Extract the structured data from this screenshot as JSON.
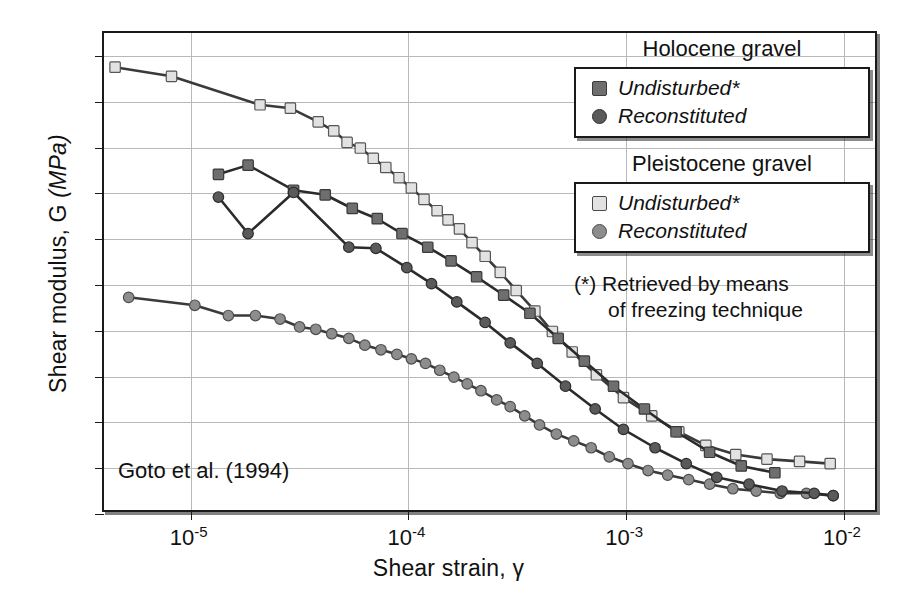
{
  "chart_data": {
    "type": "line",
    "title": "",
    "source_annotation": "Goto et al. (1994)",
    "xlabel": "Shear strain, γ",
    "ylabel": "Shear modulus, G (MPa)",
    "ylabel_plain": "Shear modulus, G ",
    "ylabel_italic": "(MPa)",
    "xscale": "log",
    "xlim": [
      4e-06,
      0.0145
    ],
    "ylim": [
      0,
      210
    ],
    "yticks": [
      0,
      20,
      40,
      60,
      80,
      100,
      120,
      140,
      160,
      180,
      200
    ],
    "ytick_labels": [
      "0",
      "20",
      "40",
      "60",
      "80",
      "100",
      "120",
      "140",
      "160",
      "180",
      "200"
    ],
    "xticks": [
      1e-05,
      0.0001,
      0.001,
      0.01
    ],
    "xtick_labels": [
      "10-5",
      "10-4",
      "10-3",
      "10-2"
    ],
    "xtick_mantissa": [
      "10",
      "10",
      "10",
      "10"
    ],
    "xtick_exponent": [
      "-5",
      "-4",
      "-3",
      "-2"
    ],
    "grid": true,
    "legend_position": "top-right",
    "series": [
      {
        "name": "Pleistocene gravel — Undisturbed*",
        "group": "Pleistocene gravel",
        "condition": "Undisturbed*",
        "marker": "square",
        "color": "#e2e2e2",
        "edge": "#555555",
        "line_color": "#3a3a3a",
        "points": [
          [
            4.5e-06,
            195
          ],
          [
            8.2e-06,
            191
          ],
          [
            2.1e-05,
            178.5
          ],
          [
            2.9e-05,
            177
          ],
          [
            3.9e-05,
            171
          ],
          [
            4.6e-05,
            167
          ],
          [
            5.3e-05,
            162
          ],
          [
            6.1e-05,
            159.5
          ],
          [
            7e-05,
            155
          ],
          [
            8e-05,
            151
          ],
          [
            9.2e-05,
            146.5
          ],
          [
            0.000105,
            142
          ],
          [
            0.00012,
            137
          ],
          [
            0.000138,
            132
          ],
          [
            0.000155,
            128
          ],
          [
            0.000175,
            124
          ],
          [
            0.0002,
            118
          ],
          [
            0.00023,
            112
          ],
          [
            0.00027,
            105
          ],
          [
            0.00032,
            97
          ],
          [
            0.00039,
            88
          ],
          [
            0.00047,
            79
          ],
          [
            0.00058,
            70
          ],
          [
            0.00075,
            60
          ],
          [
            0.001,
            50
          ],
          [
            0.00135,
            42
          ],
          [
            0.0018,
            35
          ],
          [
            0.0024,
            29
          ],
          [
            0.0033,
            25
          ],
          [
            0.0046,
            23
          ],
          [
            0.0065,
            22
          ],
          [
            0.009,
            21
          ]
        ]
      },
      {
        "name": "Holocene gravel — Undisturbed*",
        "group": "Holocene gravel",
        "condition": "Undisturbed*",
        "marker": "square",
        "color": "#6e6e6e",
        "edge": "#3a3a3a",
        "line_color": "#2b2b2b",
        "points": [
          [
            1.35e-05,
            148
          ],
          [
            1.85e-05,
            152
          ],
          [
            3e-05,
            141
          ],
          [
            4.2e-05,
            139
          ],
          [
            5.6e-05,
            133
          ],
          [
            7.3e-05,
            128.5
          ],
          [
            9.5e-05,
            122
          ],
          [
            0.000125,
            116
          ],
          [
            0.00016,
            110
          ],
          [
            0.00021,
            103
          ],
          [
            0.00028,
            95
          ],
          [
            0.00037,
            87
          ],
          [
            0.0005,
            76
          ],
          [
            0.00066,
            66
          ],
          [
            0.0009,
            55
          ],
          [
            0.00125,
            45
          ],
          [
            0.00175,
            35
          ],
          [
            0.0025,
            26
          ],
          [
            0.0035,
            20
          ],
          [
            0.005,
            17
          ]
        ]
      },
      {
        "name": "Holocene gravel — Reconstituted",
        "group": "Holocene gravel",
        "condition": "Reconstituted",
        "marker": "circle",
        "color": "#5a5a5a",
        "edge": "#2e2e2e",
        "line_color": "#2b2b2b",
        "points": [
          [
            1.35e-05,
            138
          ],
          [
            1.85e-05,
            122
          ],
          [
            3e-05,
            140
          ],
          [
            5.4e-05,
            116
          ],
          [
            7.2e-05,
            115.5
          ],
          [
            0.0001,
            107
          ],
          [
            0.00013,
            100
          ],
          [
            0.00017,
            92
          ],
          [
            0.00023,
            83
          ],
          [
            0.0003,
            74
          ],
          [
            0.0004,
            65
          ],
          [
            0.00054,
            55
          ],
          [
            0.00074,
            45
          ],
          [
            0.001,
            36
          ],
          [
            0.0014,
            28
          ],
          [
            0.00195,
            21
          ],
          [
            0.0027,
            15
          ],
          [
            0.0038,
            12
          ],
          [
            0.0054,
            9
          ],
          [
            0.0076,
            8
          ],
          [
            0.0093,
            7
          ]
        ]
      },
      {
        "name": "Pleistocene gravel — Reconstituted",
        "group": "Pleistocene gravel",
        "condition": "Reconstituted",
        "marker": "circle",
        "color": "#8d8d8d",
        "edge": "#4e4e4e",
        "line_color": "#3a3a3a",
        "points": [
          [
            5.2e-06,
            94
          ],
          [
            1.05e-05,
            90.5
          ],
          [
            1.5e-05,
            86
          ],
          [
            2e-05,
            86
          ],
          [
            2.6e-05,
            84.5
          ],
          [
            3.2e-05,
            81
          ],
          [
            3.8e-05,
            80
          ],
          [
            4.5e-05,
            78
          ],
          [
            5.4e-05,
            76
          ],
          [
            6.4e-05,
            73
          ],
          [
            7.6e-05,
            71
          ],
          [
            9e-05,
            69
          ],
          [
            0.000105,
            67
          ],
          [
            0.000122,
            65
          ],
          [
            0.000142,
            62
          ],
          [
            0.000165,
            59
          ],
          [
            0.00019,
            56
          ],
          [
            0.00022,
            53
          ],
          [
            0.00026,
            49
          ],
          [
            0.0003,
            46
          ],
          [
            0.00035,
            42
          ],
          [
            0.00041,
            38
          ],
          [
            0.00049,
            34
          ],
          [
            0.00059,
            31
          ],
          [
            0.00071,
            28
          ],
          [
            0.00086,
            24
          ],
          [
            0.00105,
            21
          ],
          [
            0.0013,
            18
          ],
          [
            0.0016,
            16
          ],
          [
            0.002,
            14
          ],
          [
            0.0025,
            12
          ],
          [
            0.0032,
            10
          ],
          [
            0.0041,
            9
          ],
          [
            0.0053,
            8
          ],
          [
            0.007,
            8
          ],
          [
            0.0093,
            7
          ]
        ]
      }
    ]
  },
  "legend": {
    "group1_title": "Holocene gravel",
    "group1_items": [
      {
        "label": "Undisturbed*",
        "marker": "square",
        "color": "#6e6e6e"
      },
      {
        "label": "Reconstituted",
        "marker": "circle",
        "color": "#5a5a5a"
      }
    ],
    "group2_title": "Pleistocene gravel",
    "group2_items": [
      {
        "label": "Undisturbed*",
        "marker": "square",
        "color": "#e2e2e2"
      },
      {
        "label": "Reconstituted",
        "marker": "circle",
        "color": "#8d8d8d"
      }
    ],
    "note_line1": "(*) Retrieved by means",
    "note_line2": "of freezing technique"
  }
}
